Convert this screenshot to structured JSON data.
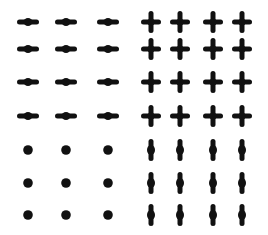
{
  "figure": {
    "color": "#111111",
    "background": "#ffffff",
    "columns_x": [
      28,
      66,
      108,
      151,
      180,
      213,
      242
    ],
    "rows_y": [
      22,
      49,
      82,
      116,
      150,
      183,
      215
    ],
    "quadrants": [
      {
        "name": "top-left",
        "glyph": "horizontal-dash",
        "cols": [
          0,
          1,
          2
        ],
        "rows": [
          0,
          1,
          2,
          3
        ]
      },
      {
        "name": "top-right",
        "glyph": "plus",
        "cols": [
          3,
          4,
          5,
          6
        ],
        "rows": [
          0,
          1,
          2,
          3
        ]
      },
      {
        "name": "bottom-left",
        "glyph": "dot",
        "cols": [
          0,
          1,
          2
        ],
        "rows": [
          4,
          5,
          6
        ]
      },
      {
        "name": "bottom-right",
        "glyph": "vertical-dash",
        "cols": [
          3,
          4,
          5,
          6
        ],
        "rows": [
          4,
          5,
          6
        ]
      }
    ]
  }
}
